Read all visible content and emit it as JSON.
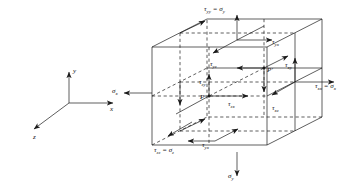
{
  "figure": {
    "name": "stress-element-cube",
    "background_color": "#ffffff",
    "line_color": "#1a1a1a"
  },
  "axes": {
    "name": "coordinate-triad",
    "origin_px": [
      69,
      103
    ],
    "labels": {
      "y": "y",
      "x": "x",
      "z": "z"
    }
  },
  "cube": {
    "front_face": {
      "left": 152,
      "right": 267,
      "top": 47,
      "bottom": 145
    },
    "depth_offset": [
      55,
      -28
    ],
    "point_labels": {
      "P": "P",
      "P_prime": "P'"
    }
  },
  "stress_labels": [
    {
      "id": "tau-yy-sigma-y",
      "text": "τyy = σy",
      "tau_sub": "yy",
      "sigma_sub": "y",
      "x": 204,
      "y": 11,
      "face": "top",
      "direction": "up"
    },
    {
      "id": "tau-yx-top",
      "text": "τyx",
      "tau_sub": "yx",
      "x": 272,
      "y": 44,
      "face": "top",
      "direction": "right"
    },
    {
      "id": "tau-yz-top",
      "text": "τyz",
      "tau_sub": "yz",
      "x": 210,
      "y": 66,
      "face": "top",
      "direction": "left-down"
    },
    {
      "id": "tau-xy-right",
      "text": "τxy",
      "tau_sub": "xy",
      "x": 285,
      "y": 67,
      "face": "right",
      "direction": "up"
    },
    {
      "id": "tau-xx-sigma-x",
      "text": "τxx = σx",
      "tau_sub": "xx",
      "sigma_sub": "x",
      "x": 315,
      "y": 88,
      "face": "right",
      "direction": "right"
    },
    {
      "id": "tau-zy-left",
      "text": "τzy",
      "tau_sub": "zy",
      "x": 199,
      "y": 84,
      "face": "front",
      "direction": "up"
    },
    {
      "id": "tau-zx-front",
      "text": "τzx",
      "tau_sub": "zx",
      "x": 228,
      "y": 106,
      "face": "front",
      "direction": "right"
    },
    {
      "id": "tau-xz-right",
      "text": "τxz",
      "tau_sub": "xz",
      "x": 272,
      "y": 110,
      "face": "right-back",
      "direction": "down-left"
    },
    {
      "id": "tau-zz-sigma-z",
      "text": "τzz = σz",
      "tau_sub": "zz",
      "sigma_sub": "z",
      "x": 154,
      "y": 152,
      "face": "back",
      "direction": "down-left"
    },
    {
      "id": "tau-yx-bottom",
      "text": "τyx",
      "tau_sub": "yx",
      "x": 202,
      "y": 147,
      "face": "bottom",
      "direction": "left"
    },
    {
      "id": "sigma-x-left",
      "text": "σx",
      "sigma_sub": "x",
      "x": 112,
      "y": 93,
      "face": "left",
      "direction": "left"
    },
    {
      "id": "sigma-y-bottom",
      "text": "σy",
      "sigma_sub": "y",
      "x": 228,
      "y": 178,
      "face": "bottom",
      "direction": "down"
    }
  ]
}
